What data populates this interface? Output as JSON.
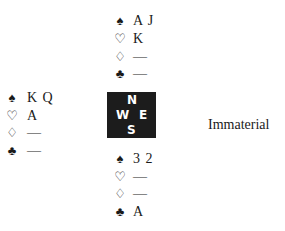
{
  "north": {
    "spades": "A J",
    "hearts": "K",
    "diamonds": "—",
    "clubs": "—"
  },
  "west": {
    "spades": "K Q",
    "hearts": "A",
    "diamonds": "—",
    "clubs": "—"
  },
  "south": {
    "spades": "3 2",
    "hearts": "—",
    "diamonds": "—",
    "clubs": "A"
  },
  "east": {
    "label": "Immaterial"
  },
  "compass": {
    "n": "N",
    "w": "W",
    "e": "E",
    "s": "S"
  },
  "suits": {
    "spades": "♠",
    "hearts": "♡",
    "diamonds": "♢",
    "clubs": "♣"
  }
}
